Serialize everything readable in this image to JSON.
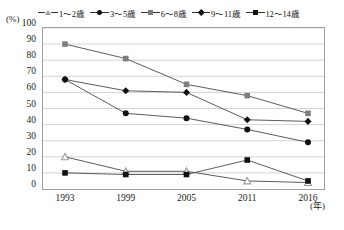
{
  "axis": {
    "y_unit": "(%)",
    "x_unit": "(年)",
    "y_ticks": [
      "100",
      "90",
      "80",
      "70",
      "60",
      "50",
      "40",
      "30",
      "20",
      "10",
      "0"
    ],
    "x_ticks": [
      "1993",
      "1999",
      "2005",
      "2011",
      "2016"
    ]
  },
  "legend": {
    "items": [
      {
        "label": "1～2歳",
        "marker": "triangle",
        "color": "#9a9a9a"
      },
      {
        "label": "3～5歳",
        "marker": "circle",
        "color": "#111111"
      },
      {
        "label": "6～8歳",
        "marker": "square",
        "color": "#7d7d7d"
      },
      {
        "label": "9～11歳",
        "marker": "diamond",
        "color": "#111111"
      },
      {
        "label": "12～14歳",
        "marker": "filled-square",
        "color": "#111111"
      }
    ]
  },
  "chart_data": {
    "type": "line",
    "title": "",
    "xlabel": "(年)",
    "ylabel": "(%)",
    "ylim": [
      0,
      100
    ],
    "ytick_step": 10,
    "grid": true,
    "legend_position": "top",
    "categories": [
      "1993",
      "1999",
      "2005",
      "2011",
      "2016"
    ],
    "series": [
      {
        "name": "1～2歳",
        "marker": "triangle",
        "color": "#9a9a9a",
        "values": [
          20,
          11,
          11,
          5,
          4
        ]
      },
      {
        "name": "3～5歳",
        "marker": "circle",
        "color": "#111111",
        "values": [
          68,
          47,
          44,
          37,
          29
        ]
      },
      {
        "name": "6～8歳",
        "marker": "square",
        "color": "#7d7d7d",
        "values": [
          90,
          81,
          65,
          58,
          47
        ]
      },
      {
        "name": "9～11歳",
        "marker": "diamond",
        "color": "#111111",
        "values": [
          68,
          61,
          60,
          43,
          42
        ]
      },
      {
        "name": "12～14歳",
        "marker": "filled-square",
        "color": "#111111",
        "values": [
          10,
          9,
          9,
          18,
          5
        ]
      }
    ]
  }
}
